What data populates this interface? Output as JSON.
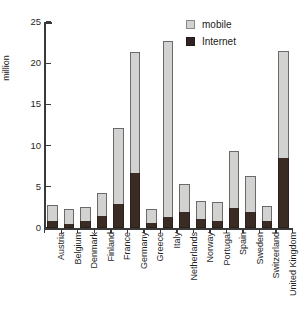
{
  "chart_data": {
    "type": "bar",
    "stacked": true,
    "title": "",
    "xlabel": "",
    "ylabel": "million",
    "ylim": [
      0,
      25
    ],
    "yticks": [
      0,
      5,
      10,
      15,
      20,
      25
    ],
    "grid": false,
    "legend_position": "top-right",
    "categories": [
      "Austria",
      "Belgium",
      "Denmark",
      "Finland",
      "France",
      "Germany",
      "Greece",
      "Italy",
      "Netherlands",
      "Norway",
      "Portugal",
      "Spain",
      "Sweden",
      "Switzerland",
      "United Kingdom"
    ],
    "series": [
      {
        "name": "Internet",
        "color": "#3a2b25",
        "values": [
          0.9,
          0.5,
          0.8,
          1.4,
          2.9,
          6.7,
          0.6,
          1.3,
          2.0,
          1.1,
          0.8,
          2.4,
          1.9,
          0.9,
          8.5
        ]
      },
      {
        "name": "mobile",
        "color": "#d2d2d0",
        "values": [
          2.8,
          2.3,
          2.5,
          4.3,
          12.1,
          21.4,
          2.3,
          22.7,
          5.4,
          3.3,
          3.2,
          9.3,
          6.3,
          2.7,
          21.5
        ]
      }
    ],
    "note": "series 'mobile' values are total bar tops; 'Internet' is the dark lower stack segment"
  },
  "legend": {
    "items": [
      {
        "label": "mobile",
        "swatch": "mobile"
      },
      {
        "label": "Internet",
        "swatch": "internet"
      }
    ]
  },
  "axis": {
    "y_title": "million"
  }
}
